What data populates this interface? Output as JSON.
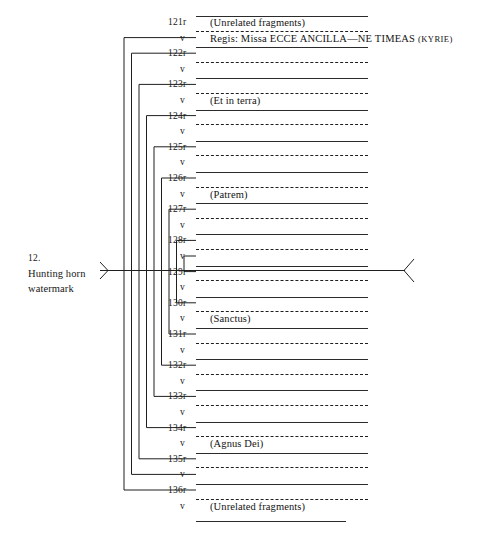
{
  "figure": {
    "caption_number": "12.",
    "caption_line1": "Hunting horn",
    "caption_line2": "watermark",
    "ink_color": "#1f1f1f",
    "background_color": "#ffffff"
  },
  "diagram": {
    "type": "quire-collation-diagram",
    "folio_range": "121r-136v",
    "bifolia_count": 16,
    "rows": [
      {
        "id": "121r",
        "label": "121r",
        "side": "recto",
        "rule": "solid",
        "title": "(Unrelated fragments)"
      },
      {
        "id": "121v",
        "label": "v",
        "side": "verso",
        "rule": "dashed",
        "title": "Regis: Missa ECCE ANCILLA—NE TIMEAS (Kyrie)"
      },
      {
        "id": "122r",
        "label": "122r",
        "side": "recto",
        "rule": "solid",
        "title": ""
      },
      {
        "id": "122v",
        "label": "v",
        "side": "verso",
        "rule": "dashed",
        "title": ""
      },
      {
        "id": "123r",
        "label": "123r",
        "side": "recto",
        "rule": "solid",
        "title": ""
      },
      {
        "id": "123v",
        "label": "v",
        "side": "verso",
        "rule": "dashed",
        "title": "(Et in terra)"
      },
      {
        "id": "124r",
        "label": "124r",
        "side": "recto",
        "rule": "solid",
        "title": ""
      },
      {
        "id": "124v",
        "label": "v",
        "side": "verso",
        "rule": "dashed",
        "title": ""
      },
      {
        "id": "125r",
        "label": "125r",
        "side": "recto",
        "rule": "solid",
        "title": ""
      },
      {
        "id": "125v",
        "label": "v",
        "side": "verso",
        "rule": "dashed",
        "title": ""
      },
      {
        "id": "126r",
        "label": "126r",
        "side": "recto",
        "rule": "solid",
        "title": ""
      },
      {
        "id": "126v",
        "label": "v",
        "side": "verso",
        "rule": "dashed",
        "title": "(Patrem)"
      },
      {
        "id": "127r",
        "label": "127r",
        "side": "recto",
        "rule": "solid",
        "title": ""
      },
      {
        "id": "127v",
        "label": "v",
        "side": "verso",
        "rule": "dashed",
        "title": ""
      },
      {
        "id": "128r",
        "label": "128r",
        "side": "recto",
        "rule": "solid",
        "title": ""
      },
      {
        "id": "128v",
        "label": "v",
        "side": "verso",
        "rule": "dashed",
        "title": ""
      },
      {
        "id": "129r",
        "label": "129r",
        "side": "recto",
        "rule": "solid",
        "title": ""
      },
      {
        "id": "129v",
        "label": "v",
        "side": "verso",
        "rule": "dashed",
        "title": ""
      },
      {
        "id": "130r",
        "label": "130r",
        "side": "recto",
        "rule": "solid",
        "title": ""
      },
      {
        "id": "130v",
        "label": "v",
        "side": "verso",
        "rule": "dashed",
        "title": "(Sanctus)"
      },
      {
        "id": "131r",
        "label": "131r",
        "side": "recto",
        "rule": "solid",
        "title": ""
      },
      {
        "id": "131v",
        "label": "v",
        "side": "verso",
        "rule": "dashed",
        "title": ""
      },
      {
        "id": "132r",
        "label": "132r",
        "side": "recto",
        "rule": "solid",
        "title": ""
      },
      {
        "id": "132v",
        "label": "v",
        "side": "verso",
        "rule": "dashed",
        "title": ""
      },
      {
        "id": "133r",
        "label": "133r",
        "side": "recto",
        "rule": "solid",
        "title": ""
      },
      {
        "id": "133v",
        "label": "v",
        "side": "verso",
        "rule": "dashed",
        "title": ""
      },
      {
        "id": "134r",
        "label": "134r",
        "side": "recto",
        "rule": "solid",
        "title": ""
      },
      {
        "id": "134v",
        "label": "v",
        "side": "verso",
        "rule": "dashed",
        "title": "(Agnus Dei)"
      },
      {
        "id": "135r",
        "label": "135r",
        "side": "recto",
        "rule": "solid",
        "title": ""
      },
      {
        "id": "135v",
        "label": "v",
        "side": "verso",
        "rule": "dashed",
        "title": ""
      },
      {
        "id": "136r",
        "label": "136r",
        "side": "recto",
        "rule": "solid",
        "title": ""
      },
      {
        "id": "136v",
        "label": "v",
        "side": "verso",
        "rule": "dashed",
        "title": "(Unrelated fragments)"
      }
    ],
    "bifolia": [
      {
        "index": 1,
        "outer": "121v",
        "inner": "136r"
      },
      {
        "index": 2,
        "outer": "122r",
        "inner": "135v"
      },
      {
        "index": 3,
        "outer": "123r",
        "inner": "135r"
      },
      {
        "index": 4,
        "outer": "124r",
        "inner": "134r"
      },
      {
        "index": 5,
        "outer": "125r",
        "inner": "133r"
      },
      {
        "index": 6,
        "outer": "126r",
        "inner": "132r"
      },
      {
        "index": 7,
        "outer": "127r",
        "inner": "131r"
      },
      {
        "index": 8,
        "outer": "128r",
        "inner": "130r"
      },
      {
        "index": 9,
        "outer": "128v",
        "inner": "129r"
      }
    ],
    "watermark_marker": {
      "label": "hunting horn watermark pointer",
      "left_arrow": "right-pointing-chevron",
      "right_arrow": "left-pointing-chevron",
      "crosses_at": "128v / 129r"
    }
  }
}
